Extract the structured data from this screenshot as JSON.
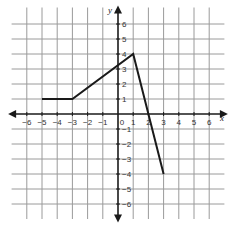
{
  "chart_data": {
    "type": "line",
    "title": "",
    "xlabel": "x",
    "ylabel": "y",
    "xlim": [
      -6,
      6
    ],
    "ylim": [
      -6,
      6
    ],
    "grid": true,
    "x_ticks": [
      "-6",
      "-5",
      "-4",
      "-3",
      "-2",
      "-1",
      "0",
      "1",
      "2",
      "3",
      "4",
      "5",
      "6"
    ],
    "y_ticks": [
      "6",
      "5",
      "4",
      "3",
      "2",
      "1",
      "-1",
      "-2",
      "-3",
      "-4",
      "-5",
      "-6"
    ],
    "series": [
      {
        "name": "piecewise function",
        "points": [
          [
            -5,
            1
          ],
          [
            -3,
            1
          ],
          [
            1,
            4
          ],
          [
            3,
            -4
          ]
        ]
      }
    ],
    "colors": {
      "grid": "#9a9a9a",
      "axis": "#1a1a1a",
      "line": "#1a1a1a"
    }
  }
}
